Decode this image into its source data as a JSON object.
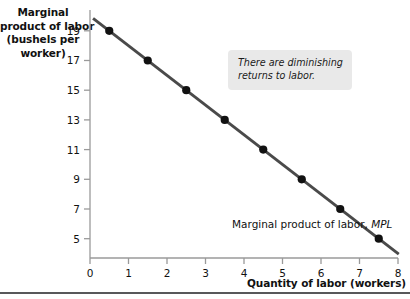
{
  "chart_data": {
    "type": "line",
    "title": "",
    "ylabel": "Marginal product of labor (bushels per worker)",
    "xlabel": "Quantity of labor (workers)",
    "xlim": [
      0,
      8
    ],
    "ylim": [
      4,
      20
    ],
    "grid": false,
    "legend_position": "inline-right",
    "series": [
      {
        "name": "Marginal product of labor, MPL",
        "x": [
          0.5,
          1.5,
          2.5,
          3.5,
          4.5,
          5.5,
          6.5,
          7.5
        ],
        "values": [
          19,
          17,
          15,
          13,
          11,
          9,
          7,
          5
        ],
        "color": "#4a4a4a",
        "marker": "circle",
        "marker_color": "#111111"
      }
    ],
    "x_ticks": [
      "0",
      "1",
      "2",
      "3",
      "4",
      "5",
      "6",
      "7",
      "8"
    ],
    "x_tick_values": [
      0,
      1,
      2,
      3,
      4,
      5,
      6,
      7,
      8
    ],
    "y_ticks": [
      "19",
      "17",
      "15",
      "13",
      "11",
      "9",
      "7",
      "5"
    ],
    "y_tick_values": [
      19,
      17,
      15,
      13,
      11,
      9,
      7,
      5
    ],
    "annotations": [
      {
        "text": "There are diminishing returns to labor.",
        "style": "callout-box"
      }
    ]
  },
  "axis_titles": {
    "y_line1": "Marginal",
    "y_line2": "product of labor",
    "y_line3": "(bushels per",
    "y_line4": "worker)",
    "x": "Quantity of labor  (workers)"
  },
  "callout": {
    "text": "There are diminishing returns to labor."
  },
  "series_label": {
    "prefix": "Marginal product of labor, ",
    "symbol": "MPL"
  },
  "colors": {
    "line": "#4a4a4a",
    "marker": "#111111",
    "axis": "#9a9a9a",
    "callout_bg": "#e9e9e9",
    "rule": "#58585a",
    "text": "#111111"
  }
}
